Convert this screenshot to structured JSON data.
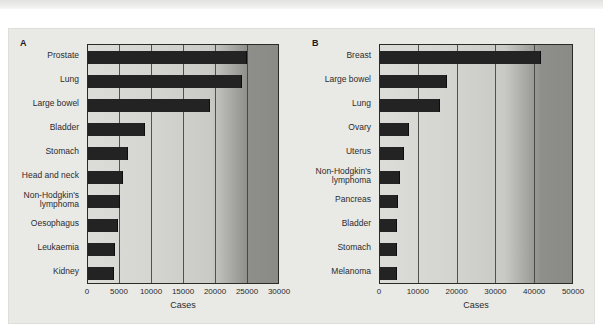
{
  "figure": {
    "background_color": "#e9e9e6",
    "bar_color": "#232323",
    "axis_color": "#2a2a2a"
  },
  "chart_data": [
    {
      "type": "bar",
      "orientation": "horizontal",
      "panel_letter": "A",
      "title": "",
      "xlabel": "Cases",
      "ylabel": "",
      "xlim": [
        0,
        30000
      ],
      "ticks": [
        "0",
        "5000",
        "10000",
        "15000",
        "20000",
        "25000",
        "30000"
      ],
      "tick_values": [
        0,
        5000,
        10000,
        15000,
        20000,
        25000,
        30000
      ],
      "grid": true,
      "legend": "none",
      "categories": [
        "Prostate",
        "Lung",
        "Large bowel",
        "Bladder",
        "Stomach",
        "Head and neck",
        "Non-Hodgkin's\nlymphoma",
        "Oesophagus",
        "Leukaemia",
        "Kidney"
      ],
      "values": [
        24700,
        23900,
        18900,
        8700,
        6100,
        5300,
        4800,
        4500,
        4100,
        3900
      ]
    },
    {
      "type": "bar",
      "orientation": "horizontal",
      "panel_letter": "B",
      "title": "",
      "xlabel": "Cases",
      "ylabel": "",
      "xlim": [
        0,
        50000
      ],
      "ticks": [
        "0",
        "10000",
        "20000",
        "30000",
        "40000",
        "50000"
      ],
      "tick_values": [
        0,
        10000,
        20000,
        30000,
        40000,
        50000
      ],
      "grid": true,
      "legend": "none",
      "categories": [
        "Breast",
        "Large bowel",
        "Lung",
        "Ovary",
        "Uterus",
        "Non-Hodgkin's\nlymphoma",
        "Pancreas",
        "Bladder",
        "Stomach",
        "Melanoma"
      ],
      "values": [
        41200,
        17100,
        15200,
        7100,
        5800,
        4800,
        4300,
        4200,
        4100,
        4000
      ]
    }
  ]
}
